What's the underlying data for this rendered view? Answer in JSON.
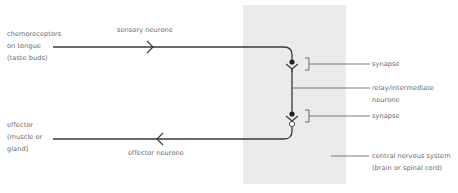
{
  "diagram": {
    "colors": {
      "background": "#ffffff",
      "cns_region": "#ebebeb",
      "line": "#3a3a3a",
      "leader": "#5a5a5a",
      "text": "#6a6a6a"
    },
    "labels": {
      "receptor": {
        "line1": "chemoreceptors",
        "line2": "on tongue",
        "line3": "(taste buds)"
      },
      "sensory_neurone": "sensory neurone",
      "synapse_top": "synapse",
      "relay": {
        "line1": "relay/intermediate",
        "line2": "neurone"
      },
      "synapse_bottom": "synapse",
      "effector": {
        "line1": "effector",
        "line2": "(muscle or",
        "line3": "gland)"
      },
      "effector_neurone": "effector neurone",
      "cns": {
        "line1": "central nervous system",
        "line2": "(brain or spinal cord)"
      }
    },
    "arrows": {
      "sensory_direction": "right",
      "effector_direction": "left"
    }
  }
}
